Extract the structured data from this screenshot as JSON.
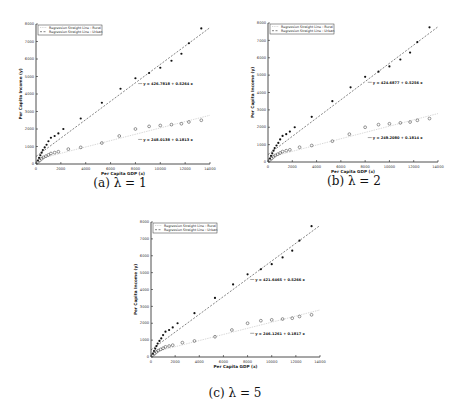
{
  "chart_data": [
    {
      "type": "scatter",
      "caption": "(a) λ = 1",
      "title": "",
      "xlabel": "Per Capita GDP (x)",
      "ylabel": "Per Capita Income (y)",
      "xlim": [
        0,
        14000
      ],
      "ylim": [
        0,
        8000
      ],
      "xticks": [
        0,
        2000,
        4000,
        6000,
        8000,
        10000,
        12000,
        14000
      ],
      "yticks": [
        0,
        1000,
        2000,
        3000,
        4000,
        5000,
        6000,
        7000,
        8000
      ],
      "grid": false,
      "legend": {
        "position": "upper left",
        "entries": [
          "Regression Straight Line : Rural",
          "Regression Straight Line : Urban"
        ]
      },
      "series": [
        {
          "name": "Urban",
          "marker": "filled-dot",
          "line": "dashed",
          "equation": "y = 426.7818 + 0.5264 x",
          "x": [
            150,
            250,
            350,
            450,
            550,
            700,
            850,
            1000,
            1200,
            1500,
            1800,
            2200,
            3600,
            5300,
            6800,
            8000,
            9100,
            10000,
            10900,
            11700,
            12300,
            13300
          ],
          "y": [
            200,
            350,
            500,
            650,
            800,
            950,
            1100,
            1300,
            1500,
            1600,
            1750,
            2000,
            2600,
            3500,
            4300,
            4900,
            5200,
            5500,
            5900,
            6300,
            6900,
            7750
          ]
        },
        {
          "name": "Rural",
          "marker": "open-circle",
          "line": "dotted",
          "equation": "y = 248.0138 + 0.1813 x",
          "x": [
            150,
            300,
            450,
            600,
            800,
            1000,
            1200,
            1500,
            1800,
            2600,
            3600,
            5300,
            6700,
            8000,
            9100,
            10000,
            10900,
            11700,
            12300,
            13300
          ],
          "y": [
            120,
            200,
            300,
            380,
            450,
            520,
            600,
            650,
            700,
            850,
            950,
            1200,
            1600,
            2000,
            2150,
            2200,
            2250,
            2300,
            2400,
            2500
          ]
        }
      ]
    },
    {
      "type": "scatter",
      "caption": "(b) λ = 2",
      "title": "",
      "xlabel": "Per Capita GDP (x)",
      "ylabel": "Per Capita Income (y)",
      "xlim": [
        0,
        14000
      ],
      "ylim": [
        0,
        8000
      ],
      "xticks": [
        0,
        2000,
        4000,
        6000,
        8000,
        10000,
        12000,
        14000
      ],
      "yticks": [
        0,
        1000,
        2000,
        3000,
        4000,
        5000,
        6000,
        7000,
        8000
      ],
      "grid": false,
      "legend": {
        "position": "upper left",
        "entries": [
          "Regression Straight Line : Rural",
          "Regression Straight Line : Urban"
        ]
      },
      "series": [
        {
          "name": "Urban",
          "marker": "filled-dot",
          "line": "dashed",
          "equation": "y = 424.6877 + 0.5256 x",
          "x": [
            150,
            250,
            350,
            450,
            550,
            700,
            850,
            1000,
            1200,
            1500,
            1800,
            2200,
            3600,
            5300,
            6800,
            8000,
            9100,
            10000,
            10900,
            11700,
            12300,
            13300
          ],
          "y": [
            200,
            350,
            500,
            650,
            800,
            950,
            1100,
            1300,
            1500,
            1600,
            1750,
            2000,
            2600,
            3500,
            4300,
            4900,
            5200,
            5500,
            5900,
            6300,
            6900,
            7750
          ]
        },
        {
          "name": "Rural",
          "marker": "open-circle",
          "line": "dotted",
          "equation": "y = 249.2080 + 0.1814 x",
          "x": [
            150,
            300,
            450,
            600,
            800,
            1000,
            1200,
            1500,
            1800,
            2600,
            3600,
            5300,
            6700,
            8000,
            9100,
            10000,
            10900,
            11700,
            12300,
            13300
          ],
          "y": [
            120,
            200,
            300,
            380,
            450,
            520,
            600,
            650,
            700,
            850,
            950,
            1200,
            1600,
            2000,
            2150,
            2200,
            2250,
            2300,
            2400,
            2500
          ]
        }
      ]
    },
    {
      "type": "scatter",
      "caption": "(c) λ = 5",
      "title": "",
      "xlabel": "Per Capita GDP (x)",
      "ylabel": "Per Capita Income (y)",
      "xlim": [
        0,
        14000
      ],
      "ylim": [
        0,
        8000
      ],
      "xticks": [
        0,
        2000,
        4000,
        6000,
        8000,
        10000,
        12000,
        14000
      ],
      "yticks": [
        0,
        1000,
        2000,
        3000,
        4000,
        5000,
        6000,
        7000,
        8000
      ],
      "grid": false,
      "legend": {
        "position": "upper left",
        "entries": [
          "Regression Straight Line : Rural",
          "Regression Straight Line : Urban"
        ]
      },
      "series": [
        {
          "name": "Urban",
          "marker": "filled-dot",
          "line": "dashed",
          "equation": "y = 421.6465 + 0.5266 x",
          "x": [
            150,
            250,
            350,
            450,
            550,
            700,
            850,
            1000,
            1200,
            1500,
            1800,
            2200,
            3600,
            5300,
            6800,
            8000,
            9100,
            10000,
            10900,
            11700,
            12300,
            13300
          ],
          "y": [
            200,
            350,
            500,
            650,
            800,
            950,
            1100,
            1300,
            1500,
            1600,
            1750,
            2000,
            2600,
            3500,
            4300,
            4900,
            5200,
            5500,
            5900,
            6300,
            6900,
            7750
          ]
        },
        {
          "name": "Rural",
          "marker": "open-circle",
          "line": "dotted",
          "equation": "y = 246.1261 + 0.1817 x",
          "x": [
            150,
            300,
            450,
            600,
            800,
            1000,
            1200,
            1500,
            1800,
            2600,
            3600,
            5300,
            6700,
            8000,
            9100,
            10000,
            10900,
            11700,
            12300,
            13300
          ],
          "y": [
            120,
            200,
            300,
            380,
            450,
            520,
            600,
            650,
            700,
            850,
            950,
            1200,
            1600,
            2000,
            2150,
            2200,
            2250,
            2300,
            2400,
            2500
          ]
        }
      ]
    }
  ]
}
